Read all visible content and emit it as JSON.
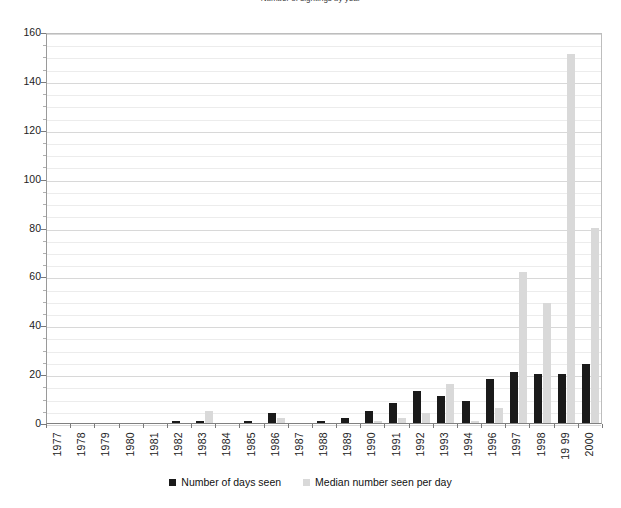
{
  "chart_data": {
    "type": "bar",
    "title": "Number of sightings by year",
    "xlabel": "",
    "ylabel": "",
    "ylim": [
      0,
      160
    ],
    "ytick_step": 20,
    "yticks": [
      0,
      20,
      40,
      60,
      80,
      100,
      120,
      140,
      160
    ],
    "ytick_labels": [
      "0",
      "20",
      "40",
      "60",
      "80",
      "100",
      "120",
      "140",
      "160"
    ],
    "minor_gridline_step": 5,
    "grid": true,
    "legend_position": "bottom",
    "categories": [
      "1977",
      "1978",
      "1979",
      "1980",
      "1981",
      "1982",
      "1983",
      "1984",
      "1985",
      "1986",
      "1987",
      "1988",
      "1989",
      "1990",
      "1991",
      "1992",
      "1993",
      "1994",
      "1996",
      "1997",
      "1998",
      "19 99",
      "2000"
    ],
    "series": [
      {
        "name": "Number of days seen",
        "color": "#1a1a1a",
        "values": [
          0,
          0,
          0,
          0,
          0,
          1,
          1,
          0,
          1,
          4,
          0,
          1,
          2,
          5,
          8,
          13,
          11,
          9,
          18,
          21,
          20,
          20,
          24
        ]
      },
      {
        "name": "Median number seen per day",
        "color": "#d9d9d9",
        "values": [
          0,
          0,
          0,
          0,
          0,
          0,
          5,
          0,
          0,
          2,
          0,
          0,
          0,
          1,
          2,
          4,
          16,
          1,
          6,
          62,
          49,
          151,
          80
        ]
      }
    ]
  },
  "legend": {
    "entries": [
      {
        "label": "Number of days seen",
        "color": "#1a1a1a"
      },
      {
        "label": "Median number seen per day",
        "color": "#d9d9d9"
      }
    ]
  }
}
